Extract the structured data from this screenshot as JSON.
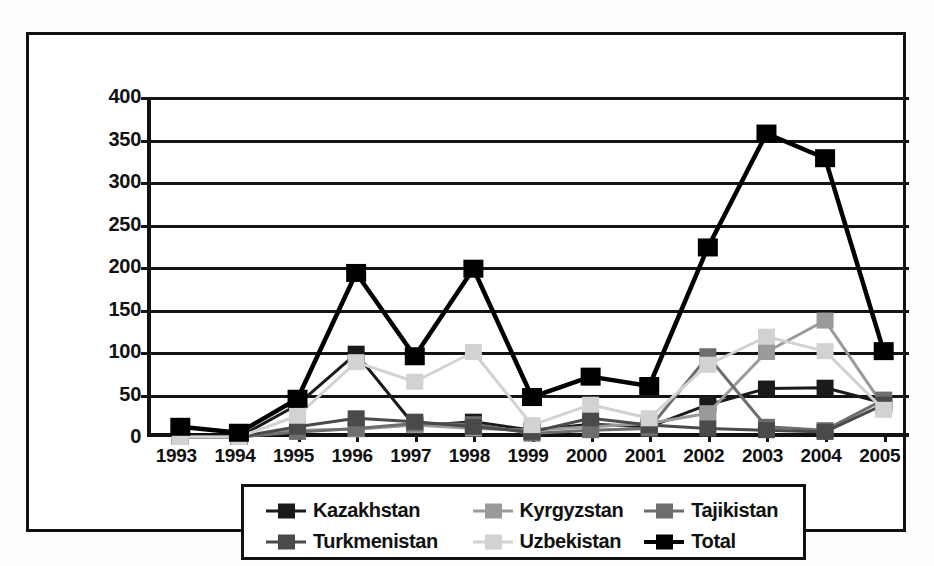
{
  "chart_data": {
    "type": "line",
    "title": "",
    "subtitle": "",
    "xlabel": "",
    "ylabel": "",
    "ylim": [
      0,
      400
    ],
    "ytick_step": 50,
    "yticks": [
      0,
      50,
      100,
      150,
      200,
      250,
      300,
      350,
      400
    ],
    "grid": true,
    "legend_position": "bottom",
    "markers": "square",
    "categories": [
      "1993",
      "1994",
      "1995",
      "1996",
      "1997",
      "1998",
      "1999",
      "2000",
      "2001",
      "2002",
      "2003",
      "2004",
      "2005"
    ],
    "series": [
      {
        "name": "Kazakhstan",
        "color": "#1a1a1a",
        "values": [
          0,
          0,
          38,
          98,
          13,
          18,
          8,
          15,
          12,
          38,
          57,
          58,
          40
        ]
      },
      {
        "name": "Kyrgyzstan",
        "color": "#9a9a9a",
        "values": [
          0,
          0,
          8,
          9,
          14,
          10,
          8,
          12,
          16,
          28,
          100,
          137,
          36
        ]
      },
      {
        "name": "Tajikistan",
        "color": "#6e6e6e",
        "values": [
          0,
          0,
          6,
          10,
          16,
          15,
          4,
          8,
          10,
          95,
          12,
          8,
          44
        ]
      },
      {
        "name": "Turkmenistan",
        "color": "#4a4a4a",
        "values": [
          0,
          0,
          12,
          22,
          18,
          12,
          6,
          22,
          14,
          10,
          8,
          6,
          38
        ]
      },
      {
        "name": "Uzbekistan",
        "color": "#d2d2d2",
        "values": [
          0,
          0,
          25,
          88,
          65,
          100,
          14,
          38,
          22,
          85,
          118,
          101,
          32
        ]
      },
      {
        "name": "Total",
        "color": "#000000",
        "values": [
          12,
          5,
          45,
          193,
          95,
          198,
          47,
          71,
          60,
          223,
          357,
          328,
          101
        ]
      }
    ]
  },
  "legend": {
    "rows": [
      [
        {
          "label": "Kazakhstan",
          "color": "#1a1a1a"
        },
        {
          "label": "Kyrgyzstan",
          "color": "#9a9a9a"
        },
        {
          "label": "Tajikistan",
          "color": "#6e6e6e"
        }
      ],
      [
        {
          "label": "Turkmenistan",
          "color": "#4a4a4a"
        },
        {
          "label": "Uzbekistan",
          "color": "#d2d2d2"
        },
        {
          "label": "Total",
          "color": "#000000"
        }
      ]
    ]
  }
}
